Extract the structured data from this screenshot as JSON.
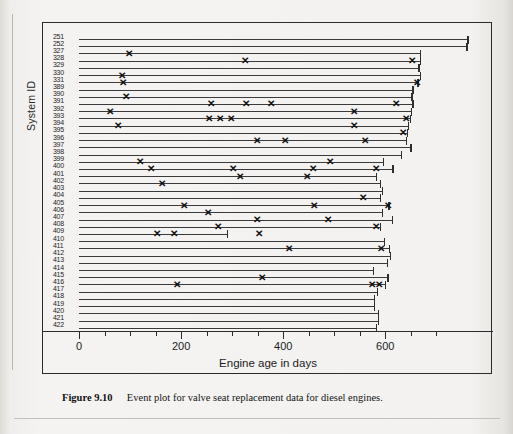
{
  "figure": {
    "caption_label": "Figure 9.10",
    "caption_text": "Event plot for valve seat replacement data for diesel engines."
  },
  "axes": {
    "xlabel": "Engine age in days",
    "ylabel": "System ID",
    "x_major_ticks": [
      0,
      200,
      400,
      600
    ],
    "x_tick_labels": [
      "0",
      "200",
      "400",
      "600"
    ],
    "x_minor_step": 50,
    "xlim": [
      -30,
      790
    ],
    "grid": false
  },
  "chart_data": {
    "type": "line",
    "title": "Event plot for valve seat replacement data for diesel engines",
    "xlabel": "Engine age in days",
    "ylabel": "System ID",
    "xlim": [
      -30,
      790
    ],
    "marker": "x",
    "legend": "none",
    "categories": [
      "251",
      "252",
      "327",
      "328",
      "329",
      "330",
      "331",
      "389",
      "390",
      "391",
      "392",
      "393",
      "394",
      "395",
      "396",
      "397",
      "398",
      "399",
      "400",
      "401",
      "402",
      "403",
      "404",
      "405",
      "406",
      "407",
      "408",
      "409",
      "410",
      "411",
      "412",
      "413",
      "414",
      "415",
      "416",
      "417",
      "418",
      "419",
      "420",
      "421",
      "422"
    ],
    "series": [
      {
        "name": "251",
        "start": 0,
        "end": 761,
        "events": []
      },
      {
        "name": "252",
        "start": 0,
        "end": 759,
        "events": []
      },
      {
        "name": "327",
        "start": 0,
        "end": 667,
        "events": [
          98
        ]
      },
      {
        "name": "328",
        "start": 0,
        "end": 667,
        "events": [
          326,
          653
        ]
      },
      {
        "name": "329",
        "start": 0,
        "end": 665,
        "events": []
      },
      {
        "name": "330",
        "start": 0,
        "end": 667,
        "events": [
          84
        ]
      },
      {
        "name": "331",
        "start": 0,
        "end": 663,
        "events": [
          87,
          663
        ]
      },
      {
        "name": "389",
        "start": 0,
        "end": 653,
        "events": []
      },
      {
        "name": "390",
        "start": 0,
        "end": 651,
        "events": [
          92
        ]
      },
      {
        "name": "391",
        "start": 0,
        "end": 653,
        "events": [
          258,
          328,
          377,
          621
        ]
      },
      {
        "name": "392",
        "start": 0,
        "end": 650,
        "events": [
          61,
          539
        ]
      },
      {
        "name": "393",
        "start": 0,
        "end": 648,
        "events": [
          254,
          276,
          298,
          640
        ]
      },
      {
        "name": "394",
        "start": 0,
        "end": 644,
        "events": [
          76,
          538
        ]
      },
      {
        "name": "395",
        "start": 0,
        "end": 642,
        "events": [
          635
        ]
      },
      {
        "name": "396",
        "start": 0,
        "end": 641,
        "events": [
          349,
          404,
          561
        ]
      },
      {
        "name": "397",
        "start": 0,
        "end": 649,
        "events": []
      },
      {
        "name": "398",
        "start": 0,
        "end": 631,
        "events": []
      },
      {
        "name": "399",
        "start": 0,
        "end": 596,
        "events": [
          120,
          492
        ]
      },
      {
        "name": "400",
        "start": 0,
        "end": 614,
        "events": [
          141,
          301,
          459,
          582
        ]
      },
      {
        "name": "401",
        "start": 0,
        "end": 582,
        "events": [
          316,
          446
        ]
      },
      {
        "name": "402",
        "start": 0,
        "end": 589,
        "events": [
          163
        ]
      },
      {
        "name": "403",
        "start": 0,
        "end": 593,
        "events": []
      },
      {
        "name": "404",
        "start": 0,
        "end": 589,
        "events": [
          557
        ]
      },
      {
        "name": "405",
        "start": 0,
        "end": 606,
        "events": [
          206,
          461,
          606
        ]
      },
      {
        "name": "406",
        "start": 0,
        "end": 594,
        "events": [
          253
        ]
      },
      {
        "name": "407",
        "start": 0,
        "end": 613,
        "events": [
          348,
          487
        ]
      },
      {
        "name": "408",
        "start": 0,
        "end": 589,
        "events": [
          272,
          582
        ]
      },
      {
        "name": "409",
        "start": 0,
        "end": 290,
        "events": [
          152,
          187,
          352
        ]
      },
      {
        "name": "410",
        "start": 0,
        "end": 598,
        "events": []
      },
      {
        "name": "411",
        "start": 0,
        "end": 607,
        "events": [
          411,
          592
        ]
      },
      {
        "name": "412",
        "start": 0,
        "end": 609,
        "events": []
      },
      {
        "name": "413",
        "start": 0,
        "end": 603,
        "events": []
      },
      {
        "name": "414",
        "start": 0,
        "end": 575,
        "events": []
      },
      {
        "name": "415",
        "start": 0,
        "end": 604,
        "events": [
          358
        ]
      },
      {
        "name": "416",
        "start": 0,
        "end": 600,
        "events": [
          191,
          573,
          587
        ]
      },
      {
        "name": "417",
        "start": 0,
        "end": 584,
        "events": []
      },
      {
        "name": "418",
        "start": 0,
        "end": 578,
        "events": []
      },
      {
        "name": "419",
        "start": 0,
        "end": 578,
        "events": []
      },
      {
        "name": "420",
        "start": 0,
        "end": 586,
        "events": []
      },
      {
        "name": "421",
        "start": 0,
        "end": 585,
        "events": []
      },
      {
        "name": "422",
        "start": 0,
        "end": 582,
        "events": []
      }
    ]
  }
}
